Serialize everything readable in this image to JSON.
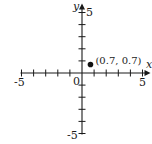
{
  "chart_data": {
    "type": "scatter",
    "title": "",
    "xlabel": "x",
    "ylabel": "y",
    "xlim": [
      -5,
      5
    ],
    "ylim": [
      -5,
      5
    ],
    "grid": false,
    "x_tick_labels": [
      "-5",
      "0",
      "5"
    ],
    "y_tick_labels": [
      "5",
      "-5"
    ],
    "origin_label": "0",
    "points": [
      {
        "x": 0.7,
        "y": 0.7,
        "label": "(0.7, 0.7)"
      }
    ]
  },
  "colors": {
    "axis": "#1a1a1a",
    "point": "#111111",
    "background": "#ffffff"
  }
}
